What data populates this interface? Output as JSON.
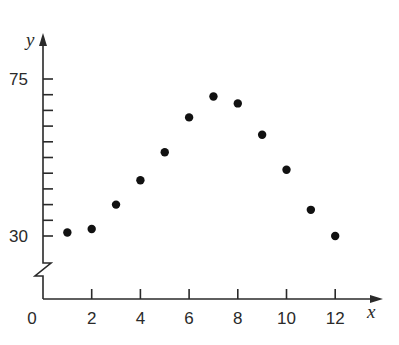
{
  "chart_data": {
    "type": "scatter",
    "title": "",
    "xlabel": "x",
    "ylabel": "y",
    "x": [
      1,
      2,
      3,
      4,
      5,
      6,
      7,
      8,
      9,
      10,
      11,
      12
    ],
    "y": [
      31,
      32,
      39,
      46,
      54,
      64,
      70,
      68,
      59,
      49,
      37.5,
      30
    ],
    "xlim": [
      0,
      12.5
    ],
    "ylim": [
      30,
      75
    ],
    "x_ticks": [
      0,
      2,
      4,
      6,
      8,
      10,
      12
    ],
    "x_tick_labels": [
      "0",
      "2",
      "4",
      "6",
      "8",
      "10",
      "12"
    ],
    "y_ticks_labeled": [
      30,
      75
    ],
    "y_tick_labels": [
      "30",
      "75"
    ],
    "y_minor_tick_count": 11,
    "y_axis_break": true,
    "grid": false,
    "legend": null,
    "marker_color": "#111111",
    "axis_color": "#2a2a2a"
  }
}
